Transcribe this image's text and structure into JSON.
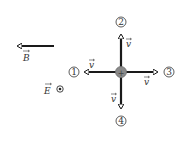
{
  "field_B": {
    "label": "B",
    "direction": "left"
  },
  "field_E": {
    "label": "E",
    "direction": "out-of-page"
  },
  "particle": {
    "charge_symbol": "+",
    "color": "#8a8a8a"
  },
  "velocities": [
    {
      "id": "1",
      "label": "v",
      "direction": "left"
    },
    {
      "id": "2",
      "label": "v",
      "direction": "up"
    },
    {
      "id": "3",
      "label": "v",
      "direction": "right"
    },
    {
      "id": "4",
      "label": "v",
      "direction": "down"
    }
  ],
  "colors": {
    "arrow": "#1a1a1a",
    "text": "#333333",
    "background": "#ffffff"
  }
}
